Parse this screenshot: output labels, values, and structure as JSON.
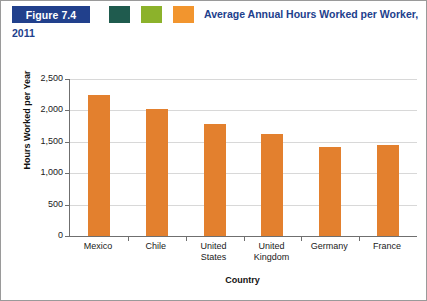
{
  "figure": {
    "badge_label": "Figure 7.4",
    "title": "Average Annual Hours Worked per Worker, 2011",
    "swatches": [
      {
        "name": "swatch-green",
        "color": "#1f5b4e"
      },
      {
        "name": "swatch-lime",
        "color": "#8cb22b"
      },
      {
        "name": "swatch-orange",
        "color": "#f2952e"
      }
    ],
    "badge_color": "#21408c",
    "title_color": "#21408c"
  },
  "chart_data": {
    "type": "bar",
    "title": "Average Annual Hours Worked per Worker, 2011",
    "categories": [
      "Mexico",
      "Chile",
      "United States",
      "United Kingdom",
      "Germany",
      "France"
    ],
    "category_lines": [
      [
        "Mexico"
      ],
      [
        "Chile"
      ],
      [
        "United",
        "States"
      ],
      [
        "United",
        "Kingdom"
      ],
      [
        "Germany"
      ],
      [
        "France"
      ]
    ],
    "values": [
      2250,
      2030,
      1790,
      1620,
      1410,
      1450
    ],
    "xlabel": "Country",
    "ylabel": "Hours Worked per Year",
    "ylim": [
      0,
      2500
    ],
    "yticks": [
      0,
      500,
      1000,
      1500,
      2000,
      2500
    ],
    "ytick_labels": [
      "0",
      "500",
      "1,000",
      "1,500",
      "2,000",
      "2,500"
    ],
    "grid": true,
    "legend": "none",
    "bar_color": "#e3802e"
  }
}
